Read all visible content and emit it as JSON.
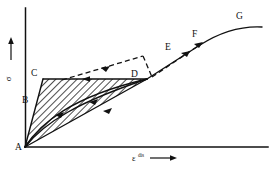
{
  "figure": {
    "type": "stress-strain-schematic-diagram",
    "background_color": "#ffffff",
    "ink_color": "#111111"
  },
  "axes": {
    "y": {
      "label": "σ",
      "superscript": "",
      "arrow": "up-arrow-icon",
      "origin_x": 25,
      "top_y": 8,
      "bottom_y": 147
    },
    "x": {
      "label": "ε",
      "superscript": "dis",
      "arrow": "right-arrow-icon",
      "origin_y": 147,
      "left_x": 25,
      "right_x": 268
    }
  },
  "points": [
    {
      "id": "A",
      "label": "A",
      "x": 25,
      "y": 147,
      "label_x": 15,
      "label_y": 147
    },
    {
      "id": "B",
      "label": "B",
      "x": 34,
      "y": 100,
      "label_x": 22,
      "label_y": 100
    },
    {
      "id": "C",
      "label": "C",
      "x": 43,
      "y": 79,
      "label_x": 31,
      "label_y": 79
    },
    {
      "id": "D",
      "label": "D",
      "x": 147,
      "y": 79,
      "label_x": 132,
      "label_y": 77
    },
    {
      "id": "E",
      "label": "E",
      "x": 178,
      "y": 51,
      "label_x": 164,
      "label_y": 48
    },
    {
      "id": "F",
      "label": "F",
      "x": 200,
      "y": 45,
      "label_x": 192,
      "label_y": 36
    },
    {
      "id": "G",
      "label": "G",
      "x": 262,
      "y": 27,
      "label_x": 236,
      "label_y": 17
    }
  ],
  "paths": {
    "loading_AC": {
      "name": "segment-a-to-c",
      "style": "solid",
      "from": "A",
      "to": "C"
    },
    "plateau_CD": {
      "name": "segment-c-to-d-plateau",
      "style": "solid",
      "from": "C",
      "to": "D",
      "arrow_direction": "left"
    },
    "chord_AD": {
      "name": "segment-a-to-d-chord",
      "style": "solid",
      "from": "A",
      "to": "D",
      "arrow_direction": "up-right"
    },
    "inner_curve_AD": {
      "name": "inner-curve-a-to-d",
      "style": "solid",
      "from": "A",
      "to": "D",
      "arrow_direction": "up-right"
    },
    "hardening_DFG": {
      "name": "curve-d-through-f-to-g",
      "style": "solid",
      "from": "D",
      "to": "G",
      "arrow_direction": "up-right"
    },
    "dashed_C_to_E": {
      "name": "dashed-branch-c-to-peak",
      "style": "dashed",
      "arrow_direction": "right"
    },
    "dashed_D_to_F": {
      "name": "dashed-branch-d-through-e-to-f",
      "style": "dashed",
      "arrow_direction": "right"
    }
  },
  "hatched_region": {
    "name": "hatched-hysteresis-area",
    "pattern": "diagonal-lines",
    "angle_degrees": 45,
    "line_color": "#111111",
    "fill_color": "#ffffff",
    "bounded_by": [
      "A",
      "C",
      "D"
    ]
  },
  "arrows": [
    {
      "name": "arrow-on-ac-curve",
      "x": 60,
      "y": 115,
      "direction": "up-right"
    },
    {
      "name": "arrow-on-inner-curve",
      "x": 95,
      "y": 104,
      "direction": "up-right"
    },
    {
      "name": "arrow-on-chord-ad",
      "x": 108,
      "y": 112,
      "direction": "up-right"
    },
    {
      "name": "arrow-on-plateau-cd",
      "x": 92,
      "y": 79,
      "direction": "left"
    },
    {
      "name": "arrow-on-dashed-upper",
      "x": 104,
      "y": 67,
      "direction": "up-right"
    },
    {
      "name": "arrow-on-dashed-de",
      "x": 196,
      "y": 45,
      "direction": "up-right"
    },
    {
      "name": "arrow-on-solid-to-f",
      "x": 185,
      "y": 53,
      "direction": "up-right"
    }
  ]
}
